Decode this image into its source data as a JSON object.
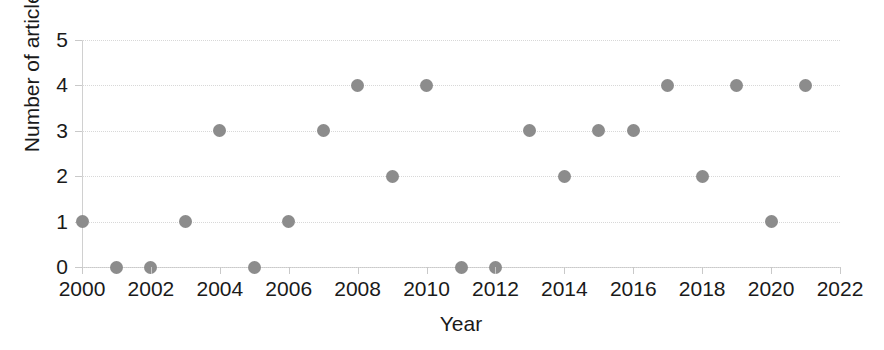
{
  "chart_data": {
    "type": "scatter",
    "title": "",
    "xlabel": "Year",
    "ylabel": "Number of articles",
    "xlim": [
      2000,
      2022
    ],
    "ylim": [
      0,
      5
    ],
    "xticks": [
      2000,
      2002,
      2004,
      2006,
      2008,
      2010,
      2012,
      2014,
      2016,
      2018,
      2020,
      2022
    ],
    "yticks": [
      0,
      1,
      2,
      3,
      4,
      5
    ],
    "grid": "horizontal-dotted",
    "legend": "none",
    "marker_color": "#8c8c8c",
    "x": [
      2000,
      2001,
      2002,
      2003,
      2004,
      2005,
      2006,
      2007,
      2008,
      2009,
      2010,
      2011,
      2012,
      2013,
      2014,
      2015,
      2016,
      2017,
      2018,
      2019,
      2020,
      2021
    ],
    "values": [
      1,
      0,
      0,
      1,
      3,
      0,
      1,
      3,
      4,
      2,
      4,
      0,
      0,
      3,
      2,
      3,
      3,
      4,
      2,
      4,
      1,
      4
    ],
    "points": [
      {
        "x": 2000,
        "y": 1
      },
      {
        "x": 2001,
        "y": 0
      },
      {
        "x": 2002,
        "y": 0
      },
      {
        "x": 2003,
        "y": 1
      },
      {
        "x": 2004,
        "y": 3
      },
      {
        "x": 2005,
        "y": 0
      },
      {
        "x": 2006,
        "y": 1
      },
      {
        "x": 2007,
        "y": 3
      },
      {
        "x": 2008,
        "y": 4
      },
      {
        "x": 2009,
        "y": 2
      },
      {
        "x": 2010,
        "y": 4
      },
      {
        "x": 2011,
        "y": 0
      },
      {
        "x": 2012,
        "y": 0
      },
      {
        "x": 2013,
        "y": 3
      },
      {
        "x": 2014,
        "y": 2
      },
      {
        "x": 2015,
        "y": 3
      },
      {
        "x": 2016,
        "y": 3
      },
      {
        "x": 2017,
        "y": 4
      },
      {
        "x": 2018,
        "y": 2
      },
      {
        "x": 2019,
        "y": 4
      },
      {
        "x": 2020,
        "y": 1
      },
      {
        "x": 2021,
        "y": 4
      }
    ]
  }
}
